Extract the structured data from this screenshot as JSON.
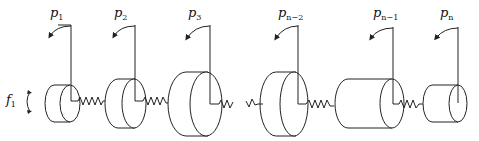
{
  "diagram": {
    "type": "torsional-spring-mass-chain",
    "force_label": {
      "base": "f",
      "sub": "1"
    },
    "masses": [
      {
        "id": "p1",
        "label_base": "p",
        "label_sub": "1"
      },
      {
        "id": "p2",
        "label_base": "p",
        "label_sub": "2"
      },
      {
        "id": "p3",
        "label_base": "p",
        "label_sub": "3"
      },
      {
        "id": "pn-2",
        "label_base": "p",
        "label_sub": "n−2"
      },
      {
        "id": "pn-1",
        "label_base": "p",
        "label_sub": "n−1"
      },
      {
        "id": "pn",
        "label_base": "p",
        "label_sub": "n"
      }
    ],
    "line_color": "#222222",
    "background": "#ffffff"
  }
}
